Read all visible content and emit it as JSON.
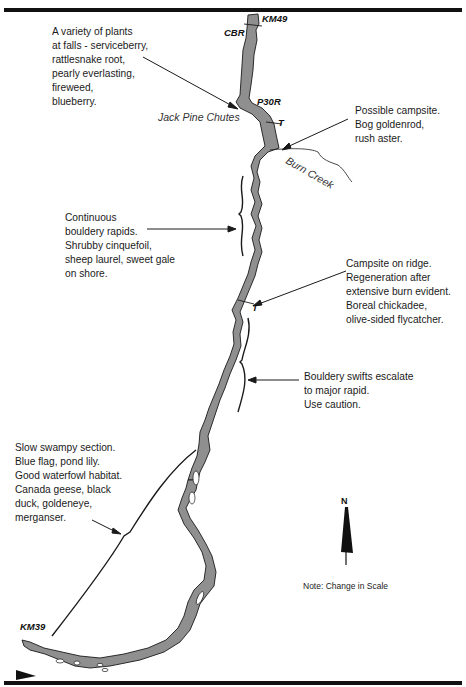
{
  "map": {
    "markers": {
      "start_km": "KM49",
      "end_km": "KM39",
      "cbr": "CBR",
      "portage": "P30R",
      "trail_1": "T",
      "trail_2": "T"
    },
    "places": {
      "jack_pine_chutes": "Jack Pine Chutes",
      "burn_creek": "Burn Creek"
    },
    "north_label": "N",
    "scale_note": "Note: Change in Scale",
    "colors": {
      "river_fill": "#8f8f8f",
      "outline": "#1a1a1a",
      "background": "#ffffff"
    }
  },
  "annotations": {
    "falls_plants": [
      "A variety of plants",
      "at falls - serviceberry,",
      "rattlesnake root,",
      "pearly everlasting,",
      "fireweed,",
      "blueberry."
    ],
    "campsite_possible": [
      "Possible campsite.",
      "Bog goldenrod,",
      "rush aster."
    ],
    "bouldery_rapids": [
      "Continuous",
      "bouldery rapids.",
      "Shrubby cinquefoil,",
      "sheep laurel, sweet gale",
      "on shore."
    ],
    "campsite_ridge": [
      "Campsite on ridge.",
      "Regeneration after",
      "extensive burn evident.",
      "Boreal chickadee,",
      "olive-sided flycatcher."
    ],
    "bouldery_swifts": [
      "Bouldery swifts escalate",
      "to major rapid.",
      "Use caution."
    ],
    "swampy_section": [
      "Slow swampy section.",
      "Blue flag, pond lily.",
      "Good waterfowl habitat.",
      "Canada geese, black",
      "duck, goldeneye,",
      "merganser."
    ]
  }
}
